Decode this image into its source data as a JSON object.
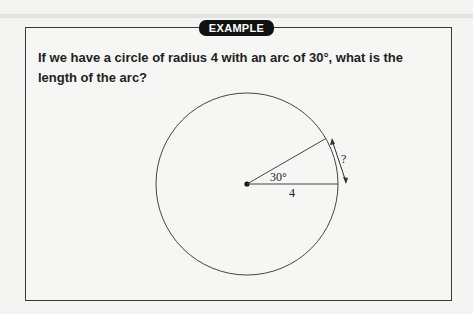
{
  "header": {
    "label": "EXAMPLE"
  },
  "question": {
    "text": "If we have a circle of radius 4 with an arc of 30°, what is the length of the arc?"
  },
  "diagram": {
    "angle_label": "30°",
    "radius_label": "4",
    "arc_label": "?"
  }
}
